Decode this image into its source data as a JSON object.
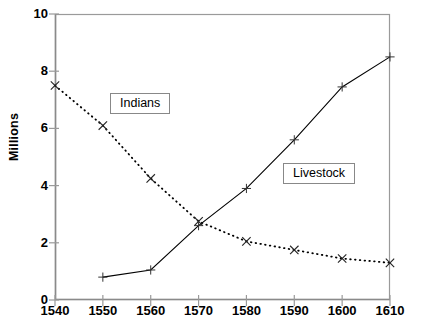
{
  "chart_data": {
    "type": "line",
    "title": "",
    "subtitle": "",
    "xlabel": "",
    "ylabel": "Millions",
    "xlim": [
      1540,
      1610
    ],
    "ylim": [
      0,
      10
    ],
    "x": [
      1540,
      1550,
      1560,
      1570,
      1580,
      1590,
      1600,
      1610
    ],
    "xticks": [
      "1540",
      "1550",
      "1560",
      "1570",
      "1580",
      "1590",
      "1600",
      "1610"
    ],
    "yticks": [
      "0",
      "2",
      "4",
      "6",
      "8",
      "10"
    ],
    "ytick_values": [
      0,
      2,
      4,
      6,
      8,
      10
    ],
    "grid": false,
    "legend_position": "inline-callouts",
    "series": [
      {
        "name": "Indians",
        "style": "dotted",
        "marker": "x",
        "color": "#000000",
        "values": [
          7.5,
          6.1,
          4.25,
          2.75,
          2.05,
          1.75,
          1.45,
          1.3
        ]
      },
      {
        "name": "Livestock",
        "style": "solid",
        "marker": "plus",
        "color": "#000000",
        "values": [
          null,
          0.8,
          1.05,
          2.6,
          3.9,
          5.6,
          7.45,
          8.5
        ]
      }
    ],
    "annotations": [
      {
        "text": "Indians",
        "x": 1563,
        "y": 6.85
      },
      {
        "text": "Livestock",
        "x": 1598,
        "y": 4.4
      }
    ]
  },
  "axes": {
    "y_title": "Millions"
  },
  "callouts": {
    "indians": "Indians",
    "livestock": "Livestock"
  }
}
